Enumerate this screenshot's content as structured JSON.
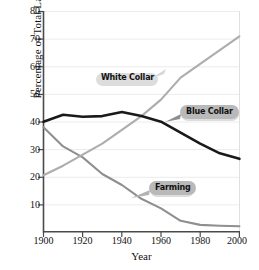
{
  "chart_data": {
    "type": "line",
    "title": "",
    "xlabel": "Year",
    "ylabel": "Percentage of Total Labor Force",
    "xlim": [
      1900,
      2000
    ],
    "ylim": [
      0,
      80
    ],
    "xticks": [
      1900,
      1920,
      1940,
      1960,
      1980,
      2000
    ],
    "yticks": [
      10,
      20,
      30,
      40,
      50,
      60,
      70,
      80
    ],
    "grid": true,
    "legend": "inline-callout-labels",
    "x": [
      1900,
      1910,
      1920,
      1930,
      1940,
      1950,
      1960,
      1970,
      1980,
      1990,
      2000
    ],
    "series": [
      {
        "name": "Blue Collar",
        "color": "#1a1a1a",
        "values": [
          40,
          42.5,
          41.8,
          42,
          43.5,
          42,
          40,
          36,
          32,
          28.5,
          26.5
        ]
      },
      {
        "name": "White Collar",
        "color": "#adadad",
        "values": [
          20.5,
          24,
          28,
          32,
          37,
          42,
          48,
          56,
          61,
          66,
          71
        ]
      },
      {
        "name": "Farming",
        "color": "#8f8f8f",
        "values": [
          38,
          31,
          27,
          21,
          17,
          12,
          8.5,
          4,
          2.5,
          2.2,
          2
        ]
      }
    ]
  },
  "axes": {
    "y_title": "Percentage of Total Labor Force",
    "x_title": "Year",
    "y_ticks": [
      "80",
      "70",
      "60",
      "50",
      "40",
      "30",
      "20",
      "10"
    ],
    "x_ticks": [
      "1900",
      "1920",
      "1940",
      "1960",
      "1980",
      "2000"
    ]
  },
  "callouts": {
    "white_collar": "White Collar",
    "blue_collar": "Blue Collar",
    "farming": "Farming"
  },
  "colors": {
    "blue_collar": "#1a1a1a",
    "white_collar": "#adadad",
    "farming": "#8f8f8f",
    "grid": "#e8e8e8",
    "axis": "#555555",
    "badge": "#b9b9b9",
    "background": "#ffffff"
  }
}
